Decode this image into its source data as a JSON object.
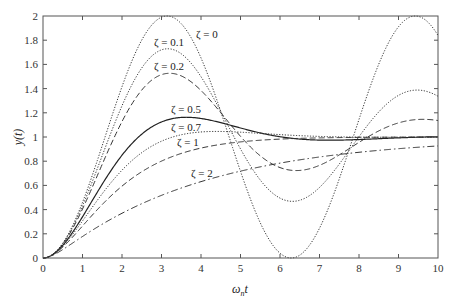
{
  "chart_data": {
    "type": "line",
    "title": "",
    "xlabel": "ω_n t",
    "ylabel": "y(t)",
    "xlim": [
      0,
      10
    ],
    "ylim": [
      0,
      2
    ],
    "x_ticks": [
      "0",
      "1",
      "2",
      "3",
      "4",
      "5",
      "6",
      "7",
      "8",
      "9",
      "10"
    ],
    "y_ticks": [
      "0",
      "0.2",
      "0.4",
      "0.6",
      "0.8",
      "1",
      "1.2",
      "1.4",
      "1.6",
      "1.8",
      "2"
    ],
    "grid": false,
    "legend": "inline curve labels",
    "x": [
      0,
      1,
      2,
      3,
      4,
      5,
      6,
      7,
      8,
      9,
      10
    ],
    "series": [
      {
        "name": "ζ = 0",
        "zeta": 0,
        "style": "dotted",
        "label": "ζ = 0",
        "values": [
          0,
          0.46,
          1.42,
          1.99,
          1.65,
          0.72,
          0.04,
          0.25,
          1.15,
          1.91,
          1.84
        ]
      },
      {
        "name": "ζ = 0.1",
        "zeta": 0.1,
        "style": "dotted",
        "label": "ζ = 0.1",
        "values": [
          0,
          0.44,
          1.31,
          1.72,
          1.41,
          0.87,
          0.55,
          0.77,
          1.15,
          1.37,
          1.29
        ]
      },
      {
        "name": "ζ = 0.2",
        "zeta": 0.2,
        "style": "dashed",
        "label": "ζ = 0.2",
        "values": [
          0,
          0.42,
          1.21,
          1.52,
          1.28,
          0.96,
          0.75,
          0.86,
          1.04,
          1.13,
          1.11
        ]
      },
      {
        "name": "ζ = 0.5",
        "zeta": 0.5,
        "style": "solid",
        "label": "ζ = 0.5",
        "values": [
          0,
          0.38,
          0.95,
          1.15,
          1.12,
          1.03,
          0.99,
          0.98,
          0.99,
          1.0,
          1.0
        ]
      },
      {
        "name": "ζ = 0.7",
        "zeta": 0.7,
        "style": "dotted",
        "label": "ζ = 0.7",
        "values": [
          0,
          0.34,
          0.82,
          1.02,
          1.04,
          1.02,
          1.0,
          1.0,
          1.0,
          1.0,
          1.0
        ]
      },
      {
        "name": "ζ = 1",
        "zeta": 1,
        "style": "dashed",
        "label": "ζ = 1",
        "values": [
          0,
          0.26,
          0.59,
          0.8,
          0.91,
          0.96,
          0.98,
          0.99,
          1.0,
          1.0,
          1.0
        ]
      },
      {
        "name": "ζ = 2",
        "zeta": 2,
        "style": "dashdot",
        "label": "ζ = 2",
        "values": [
          0,
          0.14,
          0.35,
          0.52,
          0.64,
          0.73,
          0.8,
          0.85,
          0.89,
          0.92,
          0.94
        ]
      }
    ]
  },
  "labels": {
    "zeta0": "ζ = 0",
    "zeta01": "ζ = 0.1",
    "zeta02": "ζ = 0.2",
    "zeta05": "ζ = 0.5",
    "zeta07": "ζ = 0.7",
    "zeta1": "ζ = 1",
    "zeta2": "ζ = 2",
    "xlabel_main": "ω",
    "xlabel_sub": "n",
    "xlabel_t": "t",
    "ylabel": "y(t)"
  }
}
